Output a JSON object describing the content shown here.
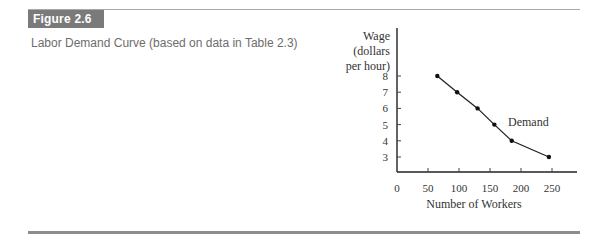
{
  "figure": {
    "label": "Figure 2.6",
    "caption": "Labor Demand Curve (based on data in Table 2.3)"
  },
  "chart_data": {
    "type": "line",
    "title": "Labor Demand Curve (based on data in Table 2.3)",
    "xlabel": "Number of Workers",
    "ylabel": "Wage (dollars per hour)",
    "ylabel_lines": [
      "Wage",
      "(dollars",
      "per hour)"
    ],
    "x_ticks": [
      0,
      50,
      100,
      150,
      200,
      250
    ],
    "y_ticks": [
      3,
      4,
      5,
      6,
      7,
      8
    ],
    "xlim": [
      0,
      280
    ],
    "ylim": [
      2,
      10
    ],
    "grid": false,
    "legend": null,
    "series": [
      {
        "name": "Demand",
        "x": [
          65,
          97,
          130,
          157,
          185,
          245
        ],
        "y": [
          8,
          7,
          6,
          5,
          4,
          3
        ]
      }
    ],
    "annotations": [
      {
        "text": "Demand",
        "near": [
          157,
          5
        ]
      }
    ]
  }
}
